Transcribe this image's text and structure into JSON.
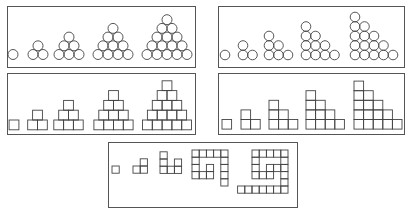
{
  "figure": {
    "stroke_color": "#444444",
    "background_color": "#ffffff",
    "panels": [
      {
        "id": "circles-centered-triangles",
        "shape": "circle",
        "arrangement": "centered-triangle",
        "terms": [
          1,
          3,
          6,
          10,
          15
        ],
        "box": {
          "x": 7,
          "y": 6,
          "w": 189,
          "h": 62
        }
      },
      {
        "id": "circles-staircase-triangles",
        "shape": "circle",
        "arrangement": "left-aligned-staircase",
        "terms": [
          1,
          3,
          6,
          10,
          15
        ],
        "box": {
          "x": 218,
          "y": 6,
          "w": 187,
          "h": 62
        }
      },
      {
        "id": "squares-centered-triangles",
        "shape": "square",
        "arrangement": "centered-triangle",
        "terms": [
          1,
          3,
          6,
          10,
          15
        ],
        "box": {
          "x": 7,
          "y": 73,
          "w": 189,
          "h": 62
        }
      },
      {
        "id": "squares-staircase-triangles",
        "shape": "square",
        "arrangement": "left-aligned-staircase",
        "terms": [
          1,
          3,
          6,
          10,
          15
        ],
        "box": {
          "x": 218,
          "y": 73,
          "w": 187,
          "h": 62
        }
      },
      {
        "id": "squares-spiral",
        "shape": "square",
        "arrangement": "spiral",
        "terms": [
          1,
          3,
          6,
          15,
          28
        ],
        "box": {
          "x": 108,
          "y": 142,
          "w": 190,
          "h": 66
        }
      }
    ]
  }
}
